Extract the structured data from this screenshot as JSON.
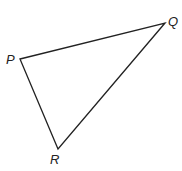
{
  "diagram": {
    "type": "triangle",
    "stroke_color": "#222222",
    "vertices": [
      {
        "label": "P",
        "x": 20,
        "y": 59
      },
      {
        "label": "Q",
        "x": 165,
        "y": 23
      },
      {
        "label": "R",
        "x": 58,
        "y": 149
      }
    ],
    "sides": [
      "PQ",
      "QR",
      "RP"
    ]
  },
  "labels": {
    "p": "P",
    "q": "Q",
    "r": "R"
  }
}
